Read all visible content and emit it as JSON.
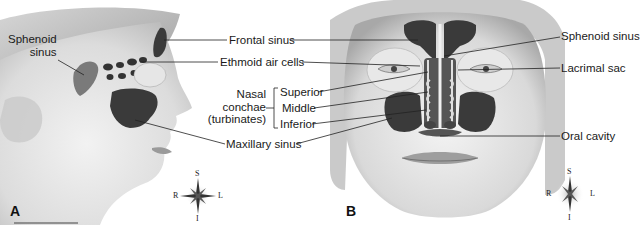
{
  "figure": {
    "panels": [
      {
        "id": "A",
        "label": "A",
        "view": "lateral"
      },
      {
        "id": "B",
        "label": "B",
        "view": "anterior"
      }
    ]
  },
  "labels": {
    "sphenoid_sinus_left": "Sphenoid\nsinus",
    "sphenoid_left_line1": "Sphenoid",
    "sphenoid_left_line2": "sinus",
    "frontal_sinus": "Frontal sinus",
    "ethmoid_air_cells": "Ethmoid air cells",
    "nasal_conchae_line1": "Nasal",
    "nasal_conchae_line2": "conchae",
    "nasal_conchae_line3": "(turbinates)",
    "superior": "Superior",
    "middle": "Middle",
    "inferior": "Inferior",
    "maxillary_sinus": "Maxillary sinus",
    "sphenoid_sinus_right": "Sphenoid sinus",
    "lacrimal_sac": "Lacrimal sac",
    "oral_cavity": "Oral cavity"
  },
  "compass": {
    "A": {
      "top": "S",
      "bottom": "I",
      "left": "R",
      "right": "L"
    },
    "B": {
      "top": "S",
      "bottom": "I",
      "left": "R",
      "right": "L"
    }
  },
  "colors": {
    "sinus_fill": "#3a3a3a",
    "skin_light": "#e8e8e8",
    "skin_mid": "#bdbdbd",
    "hair": "#9a9a9a",
    "leader_line": "#222222",
    "text": "#1a1a1a"
  }
}
